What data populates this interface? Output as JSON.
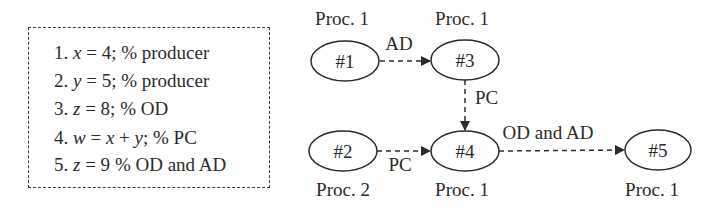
{
  "code_listing": {
    "lines": [
      {
        "num": "1.",
        "stmt_var": "x",
        "stmt_rest": " = 4;",
        "comment": " % producer"
      },
      {
        "num": "2.",
        "stmt_var": "y",
        "stmt_rest": " = 5;",
        "comment": " % producer"
      },
      {
        "num": "3.",
        "stmt_var": "z",
        "stmt_rest": " = 8;",
        "comment": " % OD"
      },
      {
        "num": "4.",
        "stmt_var": "w",
        "stmt_rest": " = ",
        "stmt_var2": "x",
        "stmt_mid": " + ",
        "stmt_var3": "y",
        "stmt_tail": ";",
        "comment": " % PC"
      },
      {
        "num": "5.",
        "stmt_var": "z",
        "stmt_rest": " = 9",
        "comment": " % OD and AD"
      }
    ]
  },
  "diagram": {
    "nodes": [
      {
        "id": "n1",
        "label": "#1",
        "proc": "Proc. 1",
        "proc_position": "above"
      },
      {
        "id": "n3",
        "label": "#3",
        "proc": "Proc. 1",
        "proc_position": "above"
      },
      {
        "id": "n2",
        "label": "#2",
        "proc": "Proc. 2",
        "proc_position": "below"
      },
      {
        "id": "n4",
        "label": "#4",
        "proc": "Proc. 1",
        "proc_position": "below"
      },
      {
        "id": "n5",
        "label": "#5",
        "proc": "Proc. 1",
        "proc_position": "below"
      }
    ],
    "edges": [
      {
        "from": "#1",
        "to": "#3",
        "label": "AD"
      },
      {
        "from": "#3",
        "to": "#4",
        "label": "PC"
      },
      {
        "from": "#2",
        "to": "#4",
        "label": "PC"
      },
      {
        "from": "#4",
        "to": "#5",
        "label": "OD and AD"
      }
    ]
  },
  "colors": {
    "stroke": "#2b2b2b",
    "background": "#ffffff"
  }
}
